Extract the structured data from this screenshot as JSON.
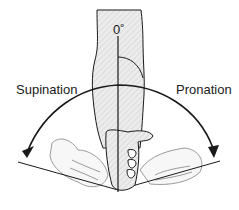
{
  "diagram": {
    "labels": {
      "zero": "0˚",
      "left": "Supination",
      "right": "Pronation"
    },
    "colors": {
      "line": "#1a1a1a",
      "skin_fill": "#e6e6e6",
      "faded_hand": "#9a9a9a"
    },
    "elements": [
      "forearm",
      "vertical-axis",
      "rotation-arc",
      "supinated-hand",
      "neutral-fist",
      "pronated-hand",
      "angle-arc"
    ]
  }
}
